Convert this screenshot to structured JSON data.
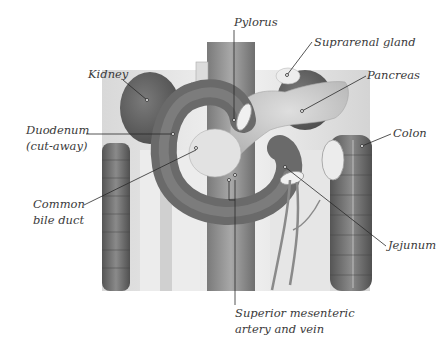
{
  "figure": {
    "type": "anatomical-illustration"
  },
  "labels": {
    "pylorus": "Pylorus",
    "suprarenal_gland": "Suprarenal  gland",
    "kidney": "Kidney",
    "pancreas": "Pancreas",
    "duodenum": {
      "line1": "Duodenum",
      "line2": "(cut-away)"
    },
    "colon": "Colon",
    "common_bile_duct": {
      "line1": "Common",
      "line2": "bile duct"
    },
    "jejunum": "Jejunum",
    "superior_mesenteric": {
      "line1": "Superior mesenteric",
      "line2": "artery and vein"
    }
  },
  "colors": {
    "background": "#ffffff",
    "label_text": "#3a3a3a",
    "leader_line": "#2a2a2a",
    "duodenum": "#6e6e6e",
    "kidney": "#5e5e5e",
    "pancreas": "#c9c9c9",
    "colon": "#707070",
    "vessel": "#8a8a8a",
    "tissue": "#e8e8e8"
  }
}
